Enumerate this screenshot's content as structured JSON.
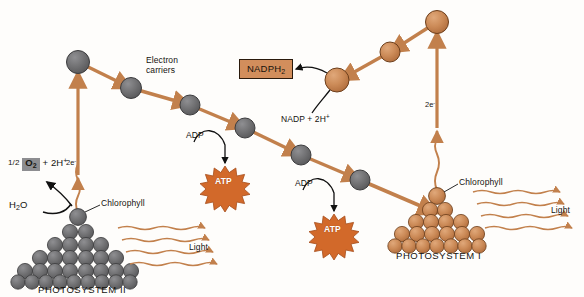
{
  "diagram": {
    "background": "#fefdfb",
    "colors": {
      "photosystem_two": "#6e6e70",
      "photosystem_one": "#c98a57",
      "arrow_orange": "#c2804c",
      "light_wave": "#c2804c",
      "atp_burst": "#d2692a",
      "nadph_box": "#d28e5c",
      "o2_box": "#8d8d90",
      "text": "#15130f",
      "black_arrow": "#111111"
    }
  },
  "photosystem_two": {
    "label": "PHOTOSYSTEM II",
    "chlorophyll_label": "Chlorophyll",
    "light_label": "Light",
    "water_label": "H",
    "water_sub": "2",
    "water_tail": "O",
    "oxygen_fraction": "1/2",
    "oxygen_box": "O",
    "oxygen_sub": "2",
    "oxygen_tail": "+ 2H",
    "oxygen_sup": "+",
    "electron_label": "2e",
    "electron_sup": "-",
    "sphere_color": "#6e6e70",
    "sphere_rows": [
      2,
      4,
      6,
      8,
      10,
      12
    ],
    "light_arrow_count": 4
  },
  "photosystem_one": {
    "label": "PHOTOSYSTEM I",
    "chlorophyll_label": "Chlorophyll",
    "light_label": "Light",
    "electron_label": "2e",
    "electron_sup": "-",
    "sphere_color": "#c98a57",
    "sphere_rows": [
      2,
      4,
      6,
      8,
      10
    ],
    "light_arrow_count": 4
  },
  "electron_carriers": {
    "label_line1": "Electron",
    "label_line2": "carriers",
    "descending_chain_count": 6,
    "ascending_chain_count": 3
  },
  "atp_events": [
    {
      "adp_label": "ADP",
      "atp_label": "ATP"
    },
    {
      "adp_label": "ADP",
      "atp_label": "ATP"
    }
  ],
  "nadph": {
    "box_label": "NADPH",
    "box_sub": "2",
    "input_label": "NADP + 2H",
    "input_sup": "+"
  }
}
